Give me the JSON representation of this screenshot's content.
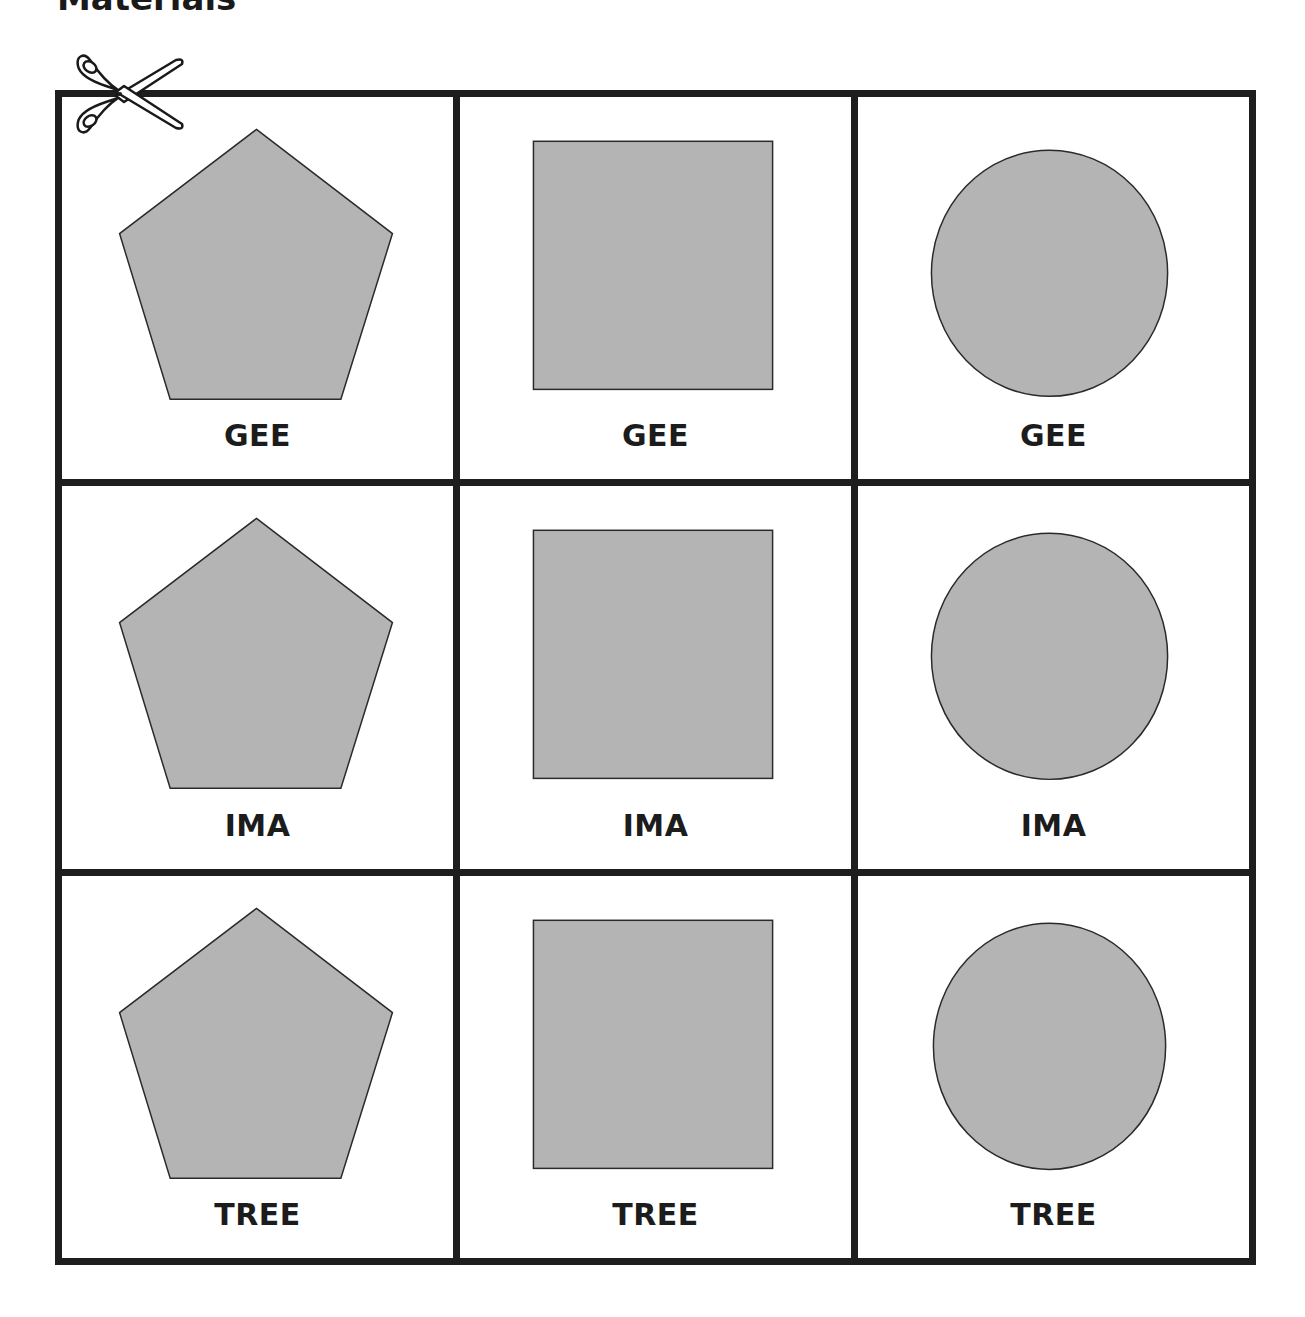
{
  "page": {
    "title": "Materials"
  },
  "colors": {
    "border": "#1e1e1e",
    "shape_fill": "#b4b4b4",
    "shape_stroke": "#2a2a2a",
    "text": "#1c1c1c"
  },
  "icons": {
    "cut_line": "scissors-icon"
  },
  "cards": [
    {
      "row": 1,
      "shape": "pentagon",
      "label": "GEE"
    },
    {
      "row": 1,
      "shape": "square",
      "label": "GEE"
    },
    {
      "row": 1,
      "shape": "circle",
      "label": "GEE"
    },
    {
      "row": 2,
      "shape": "pentagon",
      "label": "IMA"
    },
    {
      "row": 2,
      "shape": "square",
      "label": "IMA"
    },
    {
      "row": 2,
      "shape": "circle",
      "label": "IMA"
    },
    {
      "row": 3,
      "shape": "pentagon",
      "label": "TREE"
    },
    {
      "row": 3,
      "shape": "square",
      "label": "TREE"
    },
    {
      "row": 3,
      "shape": "circle",
      "label": "TREE"
    }
  ]
}
